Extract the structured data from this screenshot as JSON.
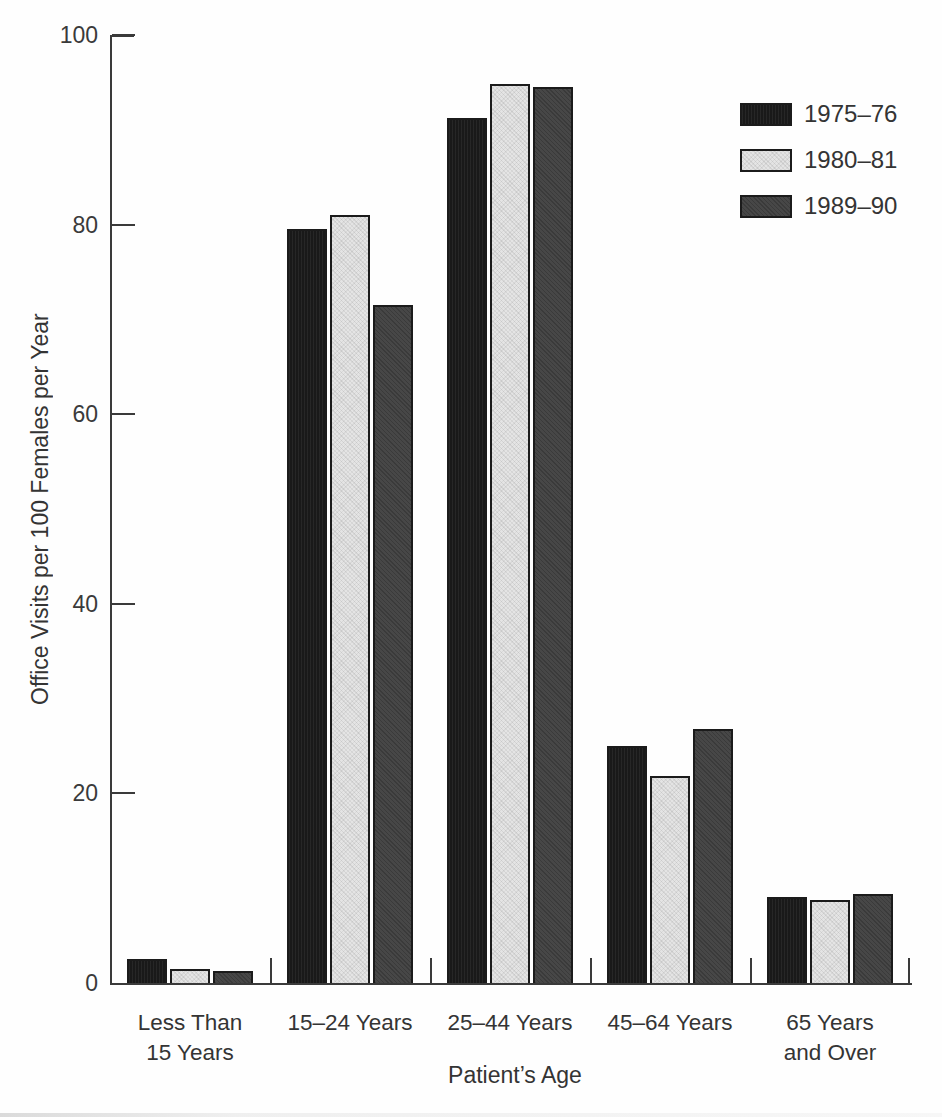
{
  "figure": {
    "xlabel": "Patient’s Age",
    "ylabel": "Office Visits per 100 Females per Year"
  },
  "chart_data": {
    "type": "bar",
    "title": "",
    "xlabel": "Patient’s Age",
    "ylabel": "Office Visits per 100 Females per Year",
    "categories": [
      "Less Than\n15 Years",
      "15–24 Years",
      "25–44 Years",
      "45–64 Years",
      "65 Years\nand Over"
    ],
    "series": [
      {
        "name": "1975–76",
        "color": "#191919",
        "values": [
          2.5,
          79.5,
          91.2,
          25.0,
          9.1
        ]
      },
      {
        "name": "1980–81",
        "color": "#e4e4e4",
        "values": [
          1.5,
          81.0,
          94.8,
          21.8,
          8.8
        ]
      },
      {
        "name": "1989–90",
        "color": "#474747",
        "values": [
          1.3,
          71.5,
          94.5,
          26.8,
          9.4
        ]
      }
    ],
    "ylim": [
      0,
      100
    ],
    "yticks": [
      0,
      20,
      40,
      60,
      80,
      100
    ],
    "grid": false,
    "legend_position": "top-right",
    "axis_color": "#3a3a3a"
  }
}
